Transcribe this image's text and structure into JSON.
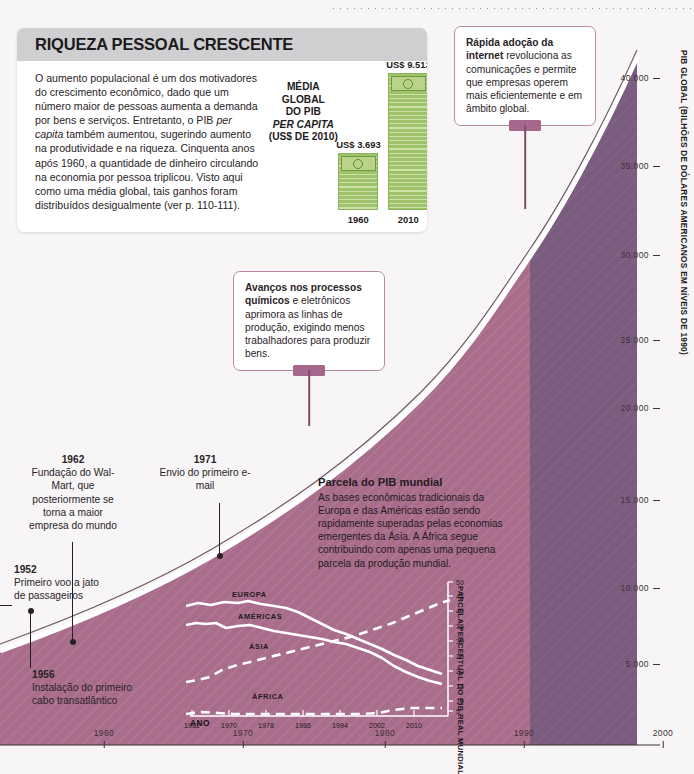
{
  "card": {
    "title": "RIQUEZA PESSOAL CRESCENTE",
    "body_html": "O aumento populacional é um dos motivadores do crescimento econômico, dado que um número maior de pessoas aumenta a demanda por bens e serviços. Entretanto, o PIB <i>per capita</i> também aumentou, sugerindo aumento na produtividade e na riqueza. Cinquenta anos após 1960, a quantidade de dinheiro circulando na economia por pessoa triplicou. Visto aqui como uma média global, tais ganhos foram distribuídos desigualmente (ver p. 110-111).",
    "bars_caption_html": "MÉDIA<br>GLOBAL<br>DO PIB<br><i>PER CAPITA</i><br>(US$ DE 2010)",
    "bars": [
      {
        "year": "1960",
        "value_label": "US$ 3.693",
        "value": 3693
      },
      {
        "year": "2010",
        "value_label": "US$ 9.513",
        "value": 9513
      }
    ]
  },
  "callouts": [
    {
      "id": "internet",
      "html": "<b>Rápida adoção da internet</b> revoluciona as comunicações e permite que empresas operem mais eficientemente e em âmbito global."
    },
    {
      "id": "quimicos",
      "html": "<b>Avanços nos processos químicos</b> e eletrônicos aprimora as linhas de produção, exigindo menos trabalhadores para produzir bens."
    }
  ],
  "events": [
    {
      "id": "1962",
      "year": "1962",
      "text": "Fundação do Wal-Mart, que posteriormente se torna a maior empresa do mundo"
    },
    {
      "id": "1971",
      "year": "1971",
      "text": "Envio do primeiro e-mail"
    },
    {
      "id": "1952",
      "year": "1952",
      "text": "Primeiro voo a jato de passageiros"
    },
    {
      "id": "1956",
      "year": "1956",
      "text": "Instalação do primeiro cabo transatlântico"
    }
  ],
  "inset_intro": {
    "heading": "Parcela do PIB mundial",
    "text": "As bases econômicas tradicionais da Europa e das Américas estão sendo rapidamente superadas pelas economias emergentes da Ásia. A África segue contribuindo com apenas uma pequena parcela da produção mundial."
  },
  "colors": {
    "area_fill": "#a96d8c",
    "area_fill_dark": "#7a5c7e",
    "area_outline": "#ffffff",
    "callout_border": "#b88aa8",
    "callout_tab": "#a5678c",
    "bar_green": "#9ec36a",
    "card_header": "#cfcfd1",
    "background": "#f7f5f6"
  },
  "chart_data": [
    {
      "type": "area",
      "title": "",
      "xlabel": "ANO",
      "ylabel": "PIB GLOBAL (BILHÕES DE DÓLARES AMERICANOS EM NÍVEIS DE 1990)",
      "xlim": [
        1950,
        2001
      ],
      "ylim": [
        0,
        42000
      ],
      "xticks": [
        1960,
        1970,
        1980,
        1990,
        2000
      ],
      "yticks": [
        5000,
        10000,
        15000,
        20000,
        25000,
        30000,
        35000,
        40000
      ],
      "ytick_labels": [
        "5.000",
        "10.000",
        "15.000",
        "20.000",
        "25.000",
        "30.000",
        "35.000",
        "40.000"
      ],
      "x": [
        1950,
        1955,
        1960,
        1965,
        1970,
        1975,
        1980,
        1985,
        1990,
        1995,
        2000
      ],
      "values": [
        5300,
        7000,
        8900,
        11600,
        14800,
        17600,
        21000,
        24200,
        28100,
        31800,
        37200
      ],
      "grid": false,
      "legend": "none"
    },
    {
      "type": "line",
      "title": "Parcela do PIB mundial",
      "xlabel": "ANO",
      "ylabel": "PARCELA PERCENTUAL DO PIB REAL MUNDIAL",
      "xlim": [
        1962,
        2014
      ],
      "ylim": [
        0,
        50
      ],
      "xticks": [
        1962,
        1970,
        1978,
        1986,
        1994,
        2002,
        2010
      ],
      "yticks": [
        5,
        10,
        15,
        20,
        25,
        30,
        35,
        40,
        45,
        50
      ],
      "x": [
        1962,
        1970,
        1978,
        1986,
        1994,
        2002,
        2010,
        2014
      ],
      "series": [
        {
          "name": "EUROPA",
          "style": "solid",
          "values": [
            41,
            41,
            39,
            37,
            34,
            31,
            27,
            25
          ]
        },
        {
          "name": "AMÉRICAS",
          "style": "solid",
          "values": [
            35,
            35,
            34,
            33,
            32,
            31,
            26,
            23
          ]
        },
        {
          "name": "ÁSIA",
          "style": "dashed",
          "values": [
            15,
            18,
            23,
            26,
            29,
            33,
            39,
            43
          ]
        },
        {
          "name": "ÁFRICA",
          "style": "dashed",
          "values": [
            4,
            4,
            4,
            4,
            4,
            4,
            5,
            5
          ]
        }
      ],
      "grid": false,
      "legend": "inline"
    }
  ]
}
